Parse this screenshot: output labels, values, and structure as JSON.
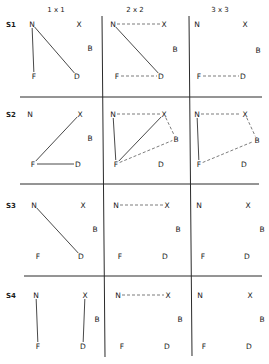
{
  "columns": [
    {
      "label": "1 x 1"
    },
    {
      "label": "2 x 2"
    },
    {
      "label": "3 x 3"
    }
  ],
  "rows": [
    {
      "label": "S1",
      "cells": [
        {
          "edges": [
            {
              "from": "N",
              "to": "F",
              "style": "solid"
            },
            {
              "from": "N",
              "to": "D",
              "style": "solid"
            }
          ]
        },
        {
          "edges": [
            {
              "from": "N",
              "to": "X",
              "style": "dashed"
            },
            {
              "from": "N",
              "to": "D",
              "style": "solid"
            },
            {
              "from": "F",
              "to": "D",
              "style": "dashed"
            }
          ]
        },
        {
          "edges": [
            {
              "from": "F",
              "to": "D",
              "style": "dashed"
            }
          ]
        }
      ]
    },
    {
      "label": "S2",
      "cells": [
        {
          "edges": [
            {
              "from": "F",
              "to": "X",
              "style": "solid"
            },
            {
              "from": "F",
              "to": "D",
              "style": "solid"
            }
          ]
        },
        {
          "edges": [
            {
              "from": "N",
              "to": "F",
              "style": "solid"
            },
            {
              "from": "N",
              "to": "X",
              "style": "dashed"
            },
            {
              "from": "F",
              "to": "X",
              "style": "solid"
            },
            {
              "from": "X",
              "to": "B",
              "style": "dashed"
            },
            {
              "from": "F",
              "to": "B",
              "style": "dashed"
            }
          ]
        },
        {
          "edges": [
            {
              "from": "N",
              "to": "F",
              "style": "solid"
            },
            {
              "from": "N",
              "to": "X",
              "style": "dashed"
            },
            {
              "from": "X",
              "to": "B",
              "style": "dashed"
            },
            {
              "from": "F",
              "to": "B",
              "style": "dashed"
            }
          ]
        }
      ]
    },
    {
      "label": "S3",
      "cells": [
        {
          "edges": [
            {
              "from": "N",
              "to": "D",
              "style": "solid"
            }
          ]
        },
        {
          "edges": [
            {
              "from": "N",
              "to": "X",
              "style": "dashed"
            }
          ]
        },
        {
          "edges": []
        }
      ]
    },
    {
      "label": "S4",
      "cells": [
        {
          "edges": [
            {
              "from": "N",
              "to": "F",
              "style": "solid"
            },
            {
              "from": "X",
              "to": "D",
              "style": "solid"
            }
          ]
        },
        {
          "edges": [
            {
              "from": "N",
              "to": "X",
              "style": "dashed"
            }
          ]
        },
        {
          "edges": []
        }
      ]
    }
  ],
  "nodes": [
    "N",
    "X",
    "B",
    "F",
    "D"
  ]
}
